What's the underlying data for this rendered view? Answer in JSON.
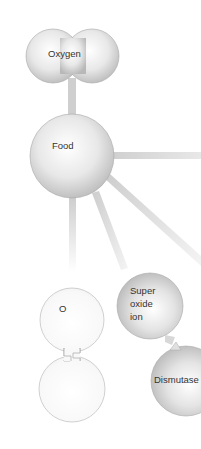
{
  "diagram": {
    "nodes": {
      "oxygen": {
        "label": "Oxygen"
      },
      "food": {
        "label": "Food"
      },
      "o_atom": {
        "label": "O"
      },
      "o_atom_pair": {
        "label": ""
      },
      "superoxide": {
        "line1": "Super",
        "line2": "oxide",
        "line3": "ion"
      },
      "dismutase": {
        "label": "Dismutase"
      }
    },
    "colors": {
      "sphere_light": "#ffffff",
      "sphere_mid": "#e6e6e6",
      "sphere_dark": "#bdbdbd",
      "connector": "#d4d4d4",
      "outline": "#a8a8a8"
    }
  }
}
